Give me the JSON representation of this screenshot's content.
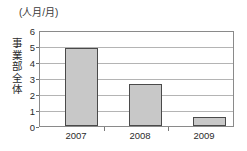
{
  "chart_data": {
    "type": "bar",
    "title": "(人月/月)",
    "xlabel": "",
    "ylabel": "事業部全体",
    "categories": [
      "2007",
      "2008",
      "2009"
    ],
    "values": [
      5.0,
      2.7,
      0.55
    ],
    "series": [
      {
        "name": "事業部全体",
        "values": [
          5.0,
          2.7,
          0.55
        ]
      }
    ],
    "ylim": [
      0,
      6
    ],
    "yticks": [
      "0",
      "1",
      "2",
      "3",
      "4",
      "5",
      "6"
    ],
    "grid": true,
    "legend": "none",
    "bar_fill_color": "#c8c8c8",
    "bar_border_color": "#4a4a4a",
    "gridline_color": "#b4b4b4",
    "frame_color": "#8a8a8a",
    "background_color": "#ffffff"
  },
  "ylabel_chars": [
    "事",
    "業",
    "部",
    "全",
    "体"
  ]
}
